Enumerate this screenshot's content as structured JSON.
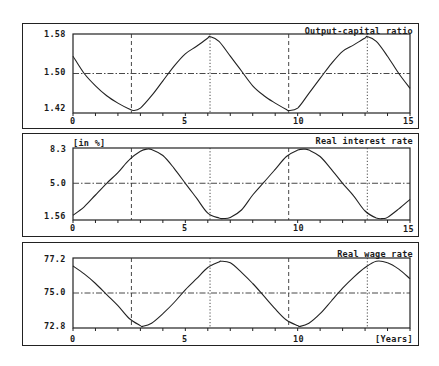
{
  "chart_data": [
    {
      "type": "line",
      "title": "Output-capital ratio",
      "unit_label": "",
      "xlabel": "",
      "ylabel": "",
      "xlim": [
        0,
        15
      ],
      "ylim": [
        1.42,
        1.58
      ],
      "yticks": [
        "1.58",
        "1.50",
        "1.42"
      ],
      "xticks": [
        "0",
        "5",
        "10",
        "15"
      ],
      "reference_y": 1.5,
      "x": [
        0,
        0.5,
        1,
        1.5,
        2,
        2.5,
        2.7,
        3,
        3.5,
        4,
        4.5,
        5,
        5.5,
        6,
        6.1,
        6.5,
        7,
        7.5,
        8,
        8.5,
        9,
        9.5,
        9.6,
        10,
        10.5,
        11,
        11.5,
        12,
        12.5,
        13,
        13.1,
        13.5,
        14,
        14.5,
        15
      ],
      "values": [
        1.535,
        1.5,
        1.475,
        1.455,
        1.44,
        1.428,
        1.425,
        1.43,
        1.455,
        1.485,
        1.515,
        1.54,
        1.555,
        1.572,
        1.575,
        1.565,
        1.535,
        1.505,
        1.475,
        1.455,
        1.44,
        1.427,
        1.425,
        1.43,
        1.46,
        1.49,
        1.52,
        1.545,
        1.558,
        1.572,
        1.575,
        1.565,
        1.535,
        1.5,
        1.47
      ]
    },
    {
      "type": "line",
      "title": "Real interest rate",
      "unit_label": "[in %]",
      "xlim": [
        0,
        15
      ],
      "ylim": [
        1.56,
        8.3
      ],
      "yticks": [
        "8.3",
        "5.0",
        "1.56"
      ],
      "xticks": [
        "0",
        "5",
        "10",
        "15"
      ],
      "reference_y": 5.0,
      "x": [
        0,
        0.5,
        1,
        1.5,
        2,
        2.5,
        3,
        3.3,
        3.5,
        4,
        4.5,
        5,
        5.5,
        6,
        6.5,
        6.7,
        7,
        7.5,
        8,
        8.5,
        9,
        9.5,
        10,
        10.3,
        10.5,
        11,
        11.5,
        12,
        12.5,
        13,
        13.5,
        13.8,
        14,
        14.5,
        15
      ],
      "values": [
        2.0,
        2.8,
        3.9,
        5.0,
        6.0,
        7.2,
        8.0,
        8.2,
        8.15,
        7.6,
        6.4,
        5.0,
        3.6,
        2.2,
        1.75,
        1.7,
        1.8,
        2.5,
        3.9,
        5.1,
        6.3,
        7.5,
        8.1,
        8.2,
        8.1,
        7.5,
        6.3,
        5.0,
        3.8,
        2.4,
        1.75,
        1.7,
        1.8,
        2.6,
        3.5
      ]
    },
    {
      "type": "line",
      "title": "Real wage rate",
      "unit_label": "",
      "xlabel": "[Years]",
      "xlim": [
        0,
        15
      ],
      "ylim": [
        72.8,
        77.2
      ],
      "yticks": [
        "77.2",
        "75.0",
        "72.8"
      ],
      "xticks": [
        "0",
        "5",
        "10",
        "[Years]"
      ],
      "reference_y": 75.0,
      "x": [
        0,
        0.5,
        1,
        1.5,
        2,
        2.5,
        3,
        3.1,
        3.5,
        4,
        4.5,
        5,
        5.5,
        6,
        6.5,
        6.6,
        7,
        7.5,
        8,
        8.5,
        9,
        9.5,
        10,
        10.1,
        10.5,
        11,
        11.5,
        12,
        12.5,
        13,
        13.5,
        14,
        14.5,
        15
      ],
      "values": [
        76.7,
        76.2,
        75.6,
        74.9,
        74.2,
        73.4,
        72.95,
        72.9,
        73.1,
        73.7,
        74.4,
        75.2,
        75.9,
        76.6,
        76.95,
        77.0,
        76.9,
        76.3,
        75.6,
        74.8,
        74.0,
        73.3,
        72.95,
        72.9,
        73.1,
        73.7,
        74.5,
        75.3,
        76.0,
        76.6,
        77.0,
        76.9,
        76.5,
        75.9
      ]
    }
  ],
  "shared": {
    "vertical_markers": [
      {
        "x": 2.6,
        "style": "dashed"
      },
      {
        "x": 6.1,
        "style": "dotted"
      },
      {
        "x": 9.6,
        "style": "dashed"
      },
      {
        "x": 13.1,
        "style": "dotted"
      }
    ],
    "minor_xtick_step": 1
  },
  "panels": [
    {
      "title": "Output-capital ratio",
      "unit": "",
      "y_top": "1.58",
      "y_mid": "1.50",
      "y_bot": "1.42",
      "x0": "0",
      "x5": "5",
      "x10": "10",
      "x15": "15"
    },
    {
      "title": "Real interest rate",
      "unit": "[in %]",
      "y_top": "8.3",
      "y_mid": "5.0",
      "y_bot": "1.56",
      "x0": "0",
      "x5": "5",
      "x10": "10",
      "x15": "15"
    },
    {
      "title": "Real wage rate",
      "unit": "",
      "y_top": "77.2",
      "y_mid": "75.0",
      "y_bot": "72.8",
      "x0": "0",
      "x5": "5",
      "x10": "10",
      "x15": "[Years]"
    }
  ]
}
